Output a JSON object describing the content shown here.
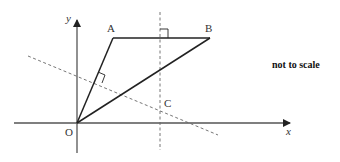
{
  "diagram": {
    "labels": {
      "y_axis": "y",
      "x_axis": "x",
      "origin": "O",
      "point_a": "A",
      "point_b": "B",
      "point_c": "C"
    },
    "note": "not to scale",
    "colors": {
      "solid_line": "#222222",
      "axis_line": "#555555",
      "dashed_line": "#666666",
      "text": "#333333"
    },
    "points": {
      "O": [
        77,
        123
      ],
      "A": [
        113,
        38
      ],
      "B": [
        210,
        38
      ],
      "C_perp_foot_x": 160
    }
  }
}
